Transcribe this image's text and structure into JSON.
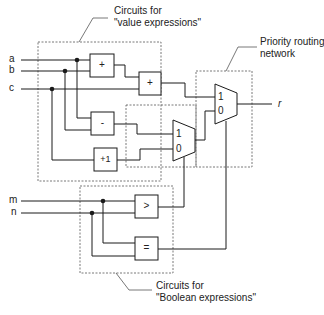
{
  "diagram": {
    "inputs": {
      "a": "a",
      "b": "b",
      "c": "c",
      "m": "m",
      "n": "n"
    },
    "output": "r",
    "operators": {
      "add1": "+",
      "add2": "+",
      "sub": "-",
      "inc": "+1",
      "gt": ">",
      "eq": "="
    },
    "mux": {
      "outer": {
        "in1": "1",
        "in0": "0"
      },
      "inner": {
        "in1": "1",
        "in0": "0"
      }
    },
    "callouts": {
      "value_expressions": {
        "line1": "Circuits for",
        "line2": "\"value expressions\""
      },
      "priority_routing": {
        "line1": "Priority routing",
        "line2": "network"
      },
      "boolean_expressions": {
        "line1": "Circuits for",
        "line2": "\"Boolean expressions\""
      }
    },
    "colors": {
      "line": "#1a1a1a",
      "dashed_box": "#555555",
      "background": "#ffffff"
    }
  }
}
